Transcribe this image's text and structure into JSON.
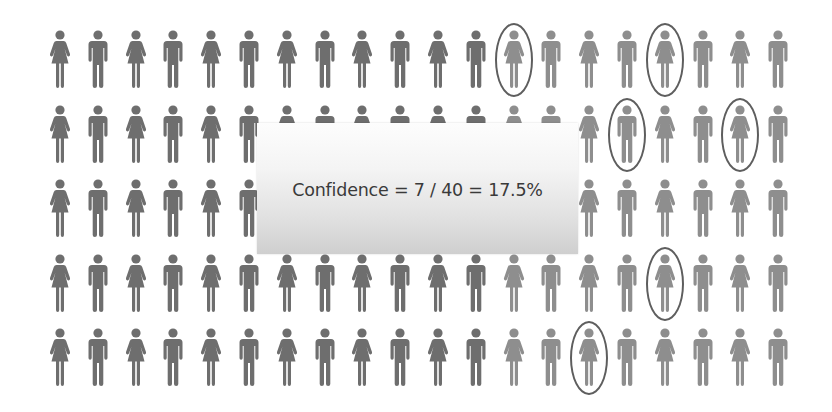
{
  "callout": {
    "text": "Confidence = 7 / 40 = 17.5%"
  },
  "grid": {
    "rows": 5,
    "columns": 20,
    "pattern": "alternating female/male, starting with female in column 0",
    "col_x_start": 48,
    "col_spacing": 37.8,
    "row_y": [
      30,
      105,
      179,
      254,
      328
    ],
    "dark_columns_until": 12,
    "colors": {
      "dark": "#6e6e6e",
      "light": "#8e8e8e",
      "ring": "#5e5e5e",
      "callout_top": "#fdfdfd",
      "callout_bottom": "#cfcfcf"
    }
  },
  "highlighted": [
    {
      "row": 0,
      "col": 12
    },
    {
      "row": 0,
      "col": 16
    },
    {
      "row": 1,
      "col": 15
    },
    {
      "row": 1,
      "col": 18
    },
    {
      "row": 3,
      "col": 16
    },
    {
      "row": 4,
      "col": 14
    }
  ]
}
